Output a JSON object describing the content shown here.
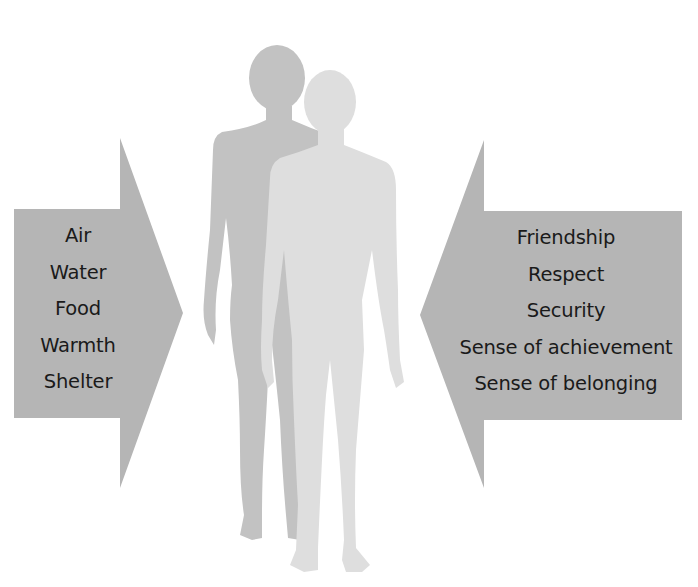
{
  "diagram": {
    "type": "needs-diagram",
    "colors": {
      "background": "#ffffff",
      "arrow_fill": "#b5b5b5",
      "text": "#1a1a1a",
      "figure_back": "#c2c2c2",
      "figure_front": "#dedede"
    },
    "left_arrow": {
      "direction": "right",
      "label": "Physical needs",
      "items": [
        "Air",
        "Water",
        "Food",
        "Warmth",
        "Shelter"
      ]
    },
    "right_arrow": {
      "direction": "left",
      "label": "Emotional and social needs",
      "items": [
        "Friendship",
        "Respect",
        "Security",
        "Sense of achievement",
        "Sense of belonging"
      ]
    },
    "figures": [
      {
        "name": "female-silhouette",
        "position": "back"
      },
      {
        "name": "male-silhouette",
        "position": "front"
      }
    ]
  }
}
